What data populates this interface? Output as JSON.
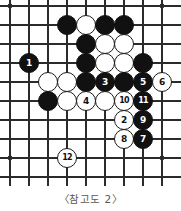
{
  "figure": {
    "caption": "〈참고도 2〉",
    "kind": "go-board-diagram"
  },
  "board": {
    "columns": 9,
    "rows": 10,
    "origin_x": 10,
    "origin_y": 6,
    "spacing": 19,
    "line_color": "#2b2b2b",
    "background_color": "#ffffff",
    "stone_radius": 10,
    "star_points": [
      {
        "col": 0,
        "row": 0
      },
      {
        "col": 8,
        "row": 0
      },
      {
        "col": 0,
        "row": 8
      },
      {
        "col": 8,
        "row": 8
      }
    ]
  },
  "stones": [
    {
      "col": 3,
      "row": 1,
      "color": "black",
      "label": ""
    },
    {
      "col": 4,
      "row": 1,
      "color": "white",
      "label": ""
    },
    {
      "col": 5,
      "row": 1,
      "color": "black",
      "label": ""
    },
    {
      "col": 6,
      "row": 1,
      "color": "black",
      "label": ""
    },
    {
      "col": 4,
      "row": 2,
      "color": "black",
      "label": ""
    },
    {
      "col": 5,
      "row": 2,
      "color": "white",
      "label": ""
    },
    {
      "col": 6,
      "row": 2,
      "color": "white",
      "label": ""
    },
    {
      "col": 1,
      "row": 3,
      "color": "black",
      "label": "1"
    },
    {
      "col": 4,
      "row": 3,
      "color": "black",
      "label": ""
    },
    {
      "col": 5,
      "row": 3,
      "color": "white",
      "label": ""
    },
    {
      "col": 6,
      "row": 3,
      "color": "white",
      "label": ""
    },
    {
      "col": 7,
      "row": 3,
      "color": "black",
      "label": ""
    },
    {
      "col": 2,
      "row": 4,
      "color": "white",
      "label": ""
    },
    {
      "col": 3,
      "row": 4,
      "color": "white",
      "label": ""
    },
    {
      "col": 4,
      "row": 4,
      "color": "black",
      "label": ""
    },
    {
      "col": 5,
      "row": 4,
      "color": "black",
      "label": "3"
    },
    {
      "col": 6,
      "row": 4,
      "color": "black",
      "label": ""
    },
    {
      "col": 7,
      "row": 4,
      "color": "black",
      "label": "5"
    },
    {
      "col": 8,
      "row": 4,
      "color": "white",
      "label": "6"
    },
    {
      "col": 2,
      "row": 5,
      "color": "black",
      "label": ""
    },
    {
      "col": 3,
      "row": 5,
      "color": "white",
      "label": ""
    },
    {
      "col": 4,
      "row": 5,
      "color": "white",
      "label": "4"
    },
    {
      "col": 5,
      "row": 5,
      "color": "white",
      "label": ""
    },
    {
      "col": 6,
      "row": 5,
      "color": "white",
      "label": "10"
    },
    {
      "col": 7,
      "row": 5,
      "color": "black",
      "label": "11"
    },
    {
      "col": 6,
      "row": 6,
      "color": "white",
      "label": "2"
    },
    {
      "col": 7,
      "row": 6,
      "color": "black",
      "label": "9"
    },
    {
      "col": 6,
      "row": 7,
      "color": "white",
      "label": "8"
    },
    {
      "col": 7,
      "row": 7,
      "color": "black",
      "label": "7"
    },
    {
      "col": 3,
      "row": 8,
      "color": "white",
      "label": "12"
    }
  ]
}
